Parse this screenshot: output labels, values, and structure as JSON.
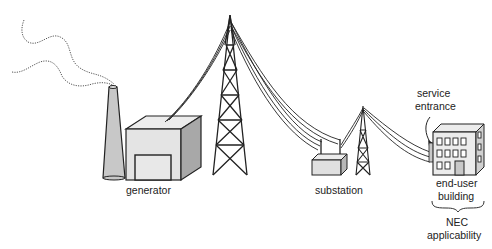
{
  "labels": {
    "generator": "generator",
    "substation": "substation",
    "service_entrance_line1": "service",
    "service_entrance_line2": "entrance",
    "end_user_line1": "end-user",
    "end_user_line2": "building",
    "nec_line1": "NEC",
    "nec_line2": "applicability"
  },
  "colors": {
    "line": "#222222",
    "fill_light": "#e4e4e4",
    "fill_mid": "#c8c8c8",
    "fill_dark": "#a8a8a8"
  }
}
